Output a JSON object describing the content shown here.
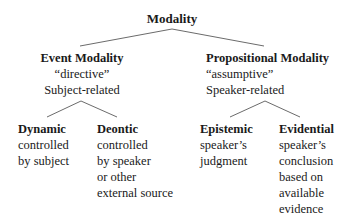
{
  "root": {
    "label": "Modality"
  },
  "branches": [
    {
      "title": "Event Modality",
      "type": "“directive”",
      "relation": "Subject-related",
      "children": [
        {
          "title": "Dynamic",
          "lines": [
            "controlled",
            "by subject"
          ]
        },
        {
          "title": "Deontic",
          "lines": [
            "controlled",
            "by speaker",
            "or other",
            "external source"
          ]
        }
      ]
    },
    {
      "title": "Propositional Modality",
      "type": "“assumptive”",
      "relation": "Speaker-related",
      "children": [
        {
          "title": "Epistemic",
          "lines": [
            "speaker’s",
            "judgment"
          ]
        },
        {
          "title": "Evidential",
          "lines": [
            "speaker’s",
            "conclusion",
            "based on",
            "available",
            "evidence"
          ]
        }
      ]
    }
  ],
  "colors": {
    "line": "#6b6b6b",
    "text": "#1a1a1a"
  }
}
